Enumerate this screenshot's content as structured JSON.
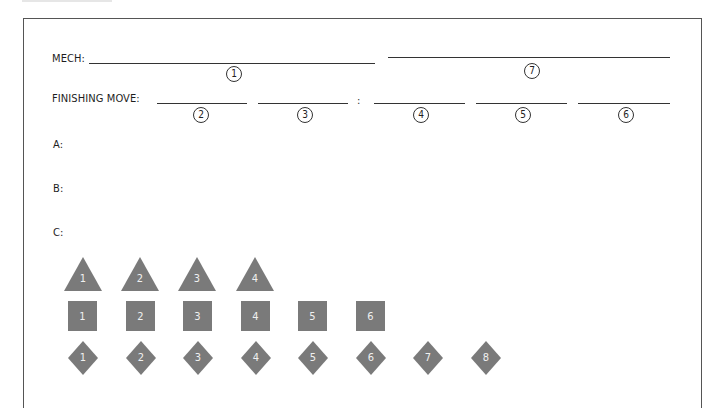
{
  "form": {
    "mech_label": "MECH:",
    "finishing_move_label": "FINISHING MOVE:",
    "separator": ":",
    "slots": {
      "s1": "1",
      "s2": "2",
      "s3": "3",
      "s4": "4",
      "s5": "5",
      "s6": "6",
      "s7": "7"
    },
    "a_label": "A:",
    "b_label": "B:",
    "c_label": "C:"
  },
  "pieces": {
    "color": "#7a7a7a",
    "triangles": [
      "1",
      "2",
      "3",
      "4"
    ],
    "squares": [
      "1",
      "2",
      "3",
      "4",
      "5",
      "6"
    ],
    "diamonds": [
      "1",
      "2",
      "3",
      "4",
      "5",
      "6",
      "7",
      "8"
    ]
  }
}
